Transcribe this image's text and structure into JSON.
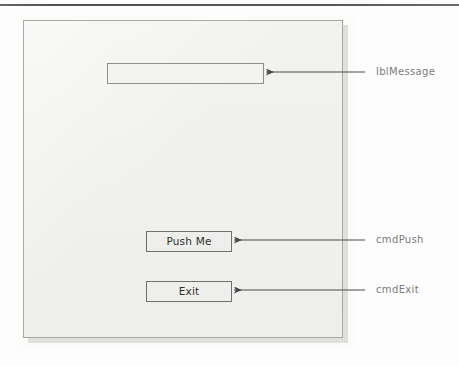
{
  "page": {
    "background_color": "#fdfdfd",
    "rule_color": "#43484b"
  },
  "form": {
    "name": "vb-form-window",
    "background_color": "#f1f1ef",
    "border_color": "#a8a8a6",
    "shadow_color": "#d9d9d7"
  },
  "controls": {
    "message_label": {
      "value": "",
      "placeholder": ""
    },
    "push_button": {
      "label": "Push Me"
    },
    "exit_button": {
      "label": "Exit"
    }
  },
  "annotations": {
    "color": "#7b7b7b",
    "items": [
      {
        "text": "lblMessage",
        "target": "message-label"
      },
      {
        "text": "cmdPush",
        "target": "push-button"
      },
      {
        "text": "cmdExit",
        "target": "exit-button"
      }
    ]
  }
}
